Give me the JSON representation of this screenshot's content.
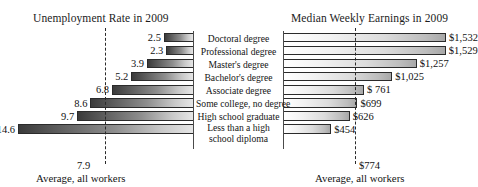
{
  "figure": {
    "left_panel_title": "Unemployment Rate in 2009",
    "right_panel_title": "Median Weekly Earnings in 2009",
    "left_average_value": "7.9",
    "right_average_value": "$774",
    "left_average_caption": "Average, all workers",
    "right_average_caption": "Average, all workers"
  },
  "categories": [
    "Doctoral degree",
    "Professional degree",
    "Master's degree",
    "Bachelor's degree",
    "Associate degree",
    "Some college, no degree",
    "High school graduate",
    "Less than a high school diploma"
  ],
  "unemployment_labels": [
    "2.5",
    "2.3",
    "3.9",
    "5.2",
    "6.8",
    "8.6",
    "9.7",
    "14.6"
  ],
  "earnings_labels": [
    "$1,532",
    "$1,529",
    "$1,257",
    "$1,025",
    "$ 761",
    "$699",
    "$626",
    "$454"
  ],
  "chart_data": [
    {
      "type": "bar",
      "title": "Unemployment Rate in 2009",
      "orientation": "horizontal",
      "direction": "leftward",
      "xlabel": "",
      "ylabel": "",
      "grid": false,
      "legend": "none",
      "categories": [
        "Doctoral degree",
        "Professional degree",
        "Master's degree",
        "Bachelor's degree",
        "Associate degree",
        "Some college, no degree",
        "High school graduate",
        "Less than a high school diploma"
      ],
      "values": [
        2.5,
        2.3,
        3.9,
        5.2,
        6.8,
        8.6,
        9.7,
        14.6
      ],
      "value_labels": [
        "2.5",
        "2.3",
        "3.9",
        "5.2",
        "6.8",
        "8.6",
        "9.7",
        "14.6"
      ],
      "xlim": [
        0,
        16
      ],
      "reference_line": {
        "label": "Average, all workers",
        "value": 7.9,
        "value_label": "7.9",
        "style": "dashed"
      }
    },
    {
      "type": "bar",
      "title": "Median Weekly Earnings in 2009",
      "orientation": "horizontal",
      "direction": "rightward",
      "xlabel": "",
      "ylabel": "",
      "grid": false,
      "legend": "none",
      "categories": [
        "Doctoral degree",
        "Professional degree",
        "Master's degree",
        "Bachelor's degree",
        "Associate degree",
        "Some college, no degree",
        "High school graduate",
        "Less than a high school diploma"
      ],
      "values": [
        1532,
        1529,
        1257,
        1025,
        761,
        699,
        626,
        454
      ],
      "value_labels": [
        "$1,532",
        "$1,529",
        "$1,257",
        "$1,025",
        "$ 761",
        "$699",
        "$626",
        "$454"
      ],
      "xlim": [
        0,
        1700
      ],
      "reference_line": {
        "label": "Average, all workers",
        "value": 774,
        "value_label": "$774",
        "style": "dashed"
      }
    }
  ],
  "colors": {
    "background": "#ffffff",
    "bar_outline": "#2b2b2b",
    "axis": "#4a4a4a",
    "dashed_line": "#2a2a2a",
    "text": "#141414"
  }
}
